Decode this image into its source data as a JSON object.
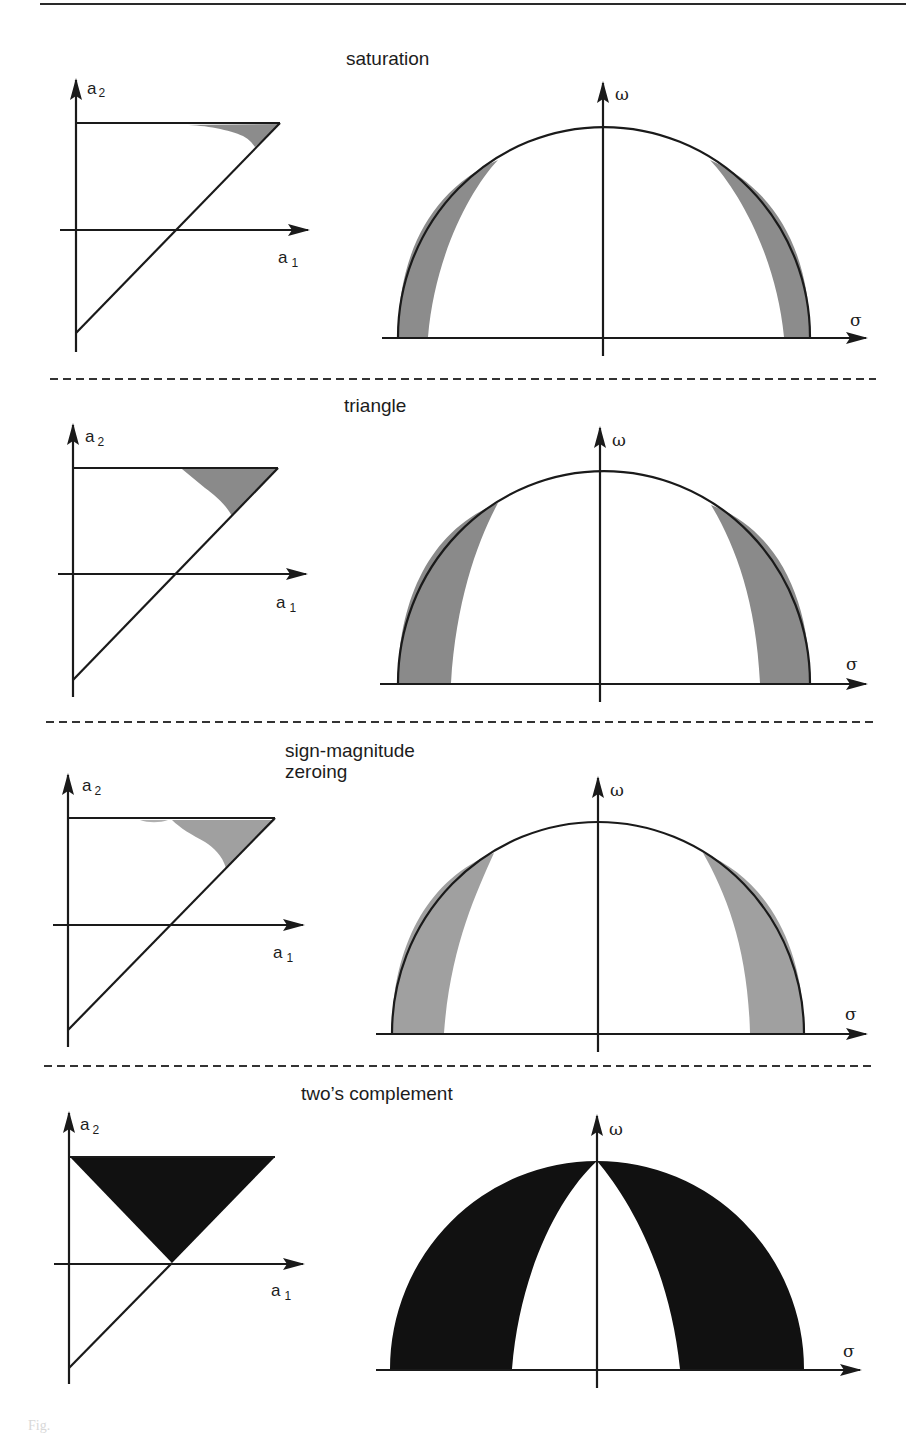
{
  "figure": {
    "caption_fragment": "Fig.",
    "panels": [
      {
        "id": "saturation",
        "title": "saturation",
        "coef_plot": {
          "x_axis_label": "a",
          "x_axis_sub": "1",
          "y_axis_label": "a",
          "y_axis_sub": "2",
          "shaded_region": "small sliver near top-right corner of triangle"
        },
        "pole_plot": {
          "x_axis_label": "σ",
          "y_axis_label": "ω",
          "shaded_region": "thin crescent along unit circle edges"
        },
        "fill_color": "#8c8c8c"
      },
      {
        "id": "triangle",
        "title": "triangle",
        "coef_plot": {
          "x_axis_label": "a",
          "x_axis_sub": "1",
          "y_axis_label": "a",
          "y_axis_sub": "2",
          "shaded_region": "triangular wedge at top-right corner"
        },
        "pole_plot": {
          "x_axis_label": "σ",
          "y_axis_label": "ω",
          "shaded_region": "wider bands along circle edges"
        },
        "fill_color": "#8a8a8a"
      },
      {
        "id": "sign-magnitude-zeroing",
        "title": "sign-magnitude\nzeroing",
        "coef_plot": {
          "x_axis_label": "a",
          "x_axis_sub": "1",
          "y_axis_label": "a",
          "y_axis_sub": "2",
          "shaded_region": "curved wedge at top-right corner"
        },
        "pole_plot": {
          "x_axis_label": "σ",
          "y_axis_label": "ω",
          "shaded_region": "bands along circle edges"
        },
        "fill_color": "#a0a0a0"
      },
      {
        "id": "twos-complement",
        "title": "two’s complement",
        "coef_plot": {
          "x_axis_label": "a",
          "x_axis_sub": "1",
          "y_axis_label": "a",
          "y_axis_sub": "2",
          "shaded_region": "inverted triangle from top edge to a1-axis crossing"
        },
        "pole_plot": {
          "x_axis_label": "σ",
          "y_axis_label": "ω",
          "shaded_region": "large black lunes meeting at top of circle"
        },
        "fill_color": "#111111"
      }
    ]
  }
}
